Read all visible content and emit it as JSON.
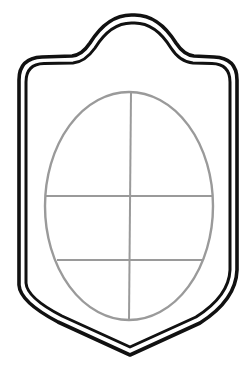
{
  "diagram": {
    "colors": {
      "background": "#ffffff",
      "shield_stroke": "#111111",
      "window_stroke": "#9a9a9a"
    },
    "shield": {
      "shape": "escutcheon with arched crest and pointed base",
      "border": "double line"
    },
    "window": {
      "shape": "ellipse",
      "mullions": 1,
      "transoms": 2,
      "panes": 6
    }
  }
}
